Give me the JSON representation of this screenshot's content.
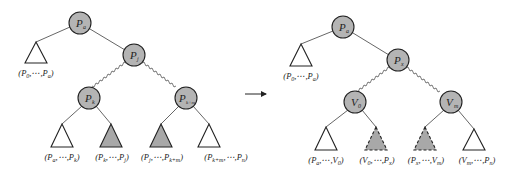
{
  "diagram": {
    "colors": {
      "node_fill": "#b4b4b4",
      "shaded_fill": "#a8a8a8",
      "stroke": "#222222",
      "edge": "#555555"
    },
    "left_tree": {
      "nodes": {
        "root": "P",
        "root_sub": "a",
        "right_child": "P",
        "right_child_sub": "j",
        "left_grandchild": "P",
        "left_grandchild_sub": "k",
        "right_grandchild": "P",
        "right_grandchild_sub": "k+m"
      },
      "subtree_labels": [
        "(P0,⋯,Pa)",
        "(Pa,⋯,Pk)",
        "(Pk,⋯,Pj)",
        "(Pj,⋯,Pk+m)",
        "(Pk+m,⋯,Pn)"
      ]
    },
    "arrow": "→",
    "right_tree": {
      "nodes": {
        "root": "P",
        "root_sub": "a",
        "right_child": "P",
        "right_child_sub": "x",
        "left_grandchild": "V",
        "left_grandchild_sub": "0",
        "right_grandchild": "V",
        "right_grandchild_sub": "m"
      },
      "subtree_labels": [
        "(P0,⋯,Pa)",
        "(Pa,⋯,V0)",
        "(V0,⋯,Px)",
        "(Px,⋯,Vm)",
        "(Vm,⋯,Pn)"
      ]
    }
  }
}
